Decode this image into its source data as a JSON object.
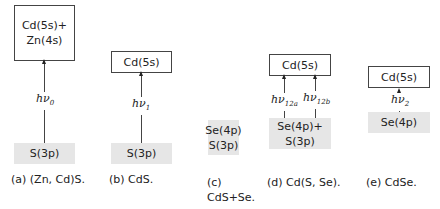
{
  "panels": [
    {
      "id": "a",
      "upper_lines": [
        "Cd(5s)+",
        "Zn(4s)"
      ],
      "transition": "hν",
      "transition_sub": "0",
      "lower_lines": [
        "S(3p)"
      ],
      "caption": "(a) (Zn, Cd)S."
    },
    {
      "id": "b",
      "upper_lines": [
        "Cd(5s)"
      ],
      "transition": "hν",
      "transition_sub": "1",
      "lower_lines": [
        "S(3p)"
      ],
      "caption": "(b) CdS."
    },
    {
      "id": "c",
      "upper_lines": [],
      "lower_lines": [
        "Se(4p)",
        "S(3p)"
      ],
      "caption_line1": "(c)",
      "caption_line2": "CdS+Se."
    },
    {
      "id": "d",
      "upper_lines": [
        "Cd(5s)"
      ],
      "transition_a": "hν",
      "transition_a_sub": "12a",
      "transition_b": "hν",
      "transition_b_sub": "12b",
      "lower_lines": [
        "Se(4p)+",
        "S(3p)"
      ],
      "caption": "(d) Cd(S, Se)."
    },
    {
      "id": "e",
      "upper_lines": [
        "Cd(5s)"
      ],
      "transition": "hν",
      "transition_sub": "2",
      "lower_lines": [
        "Se(4p)"
      ],
      "caption": "(e) CdSe."
    }
  ]
}
